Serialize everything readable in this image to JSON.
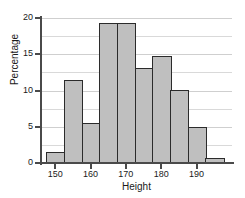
{
  "chart_data": {
    "type": "bar",
    "title": "",
    "subtitle": "",
    "xlabel": "Height",
    "ylabel": "Percentage",
    "xlim": [
      146,
      200
    ],
    "ylim": [
      0,
      20
    ],
    "grid": true,
    "legend": false,
    "legend_position": "none",
    "bar_color": "#bfbfbf",
    "bar_edge_color": "#2b2b2b",
    "grid_color": "#d9d9d9",
    "axis_color": "#4a4a4a",
    "bin_width": 5,
    "y_ticks": [
      "0",
      "5",
      "10",
      "15",
      "20"
    ],
    "y_tick_values": [
      0,
      5,
      10,
      15,
      20
    ],
    "y_minor_gridlines": [
      2.5,
      7.5,
      12.5,
      17.5
    ],
    "x_ticks": [
      "150",
      "160",
      "170",
      "180",
      "190"
    ],
    "x_tick_values": [
      150,
      160,
      170,
      180,
      190
    ],
    "categories": [
      "147.5-152.5",
      "152.5-157.5",
      "157.5-162.5",
      "162.5-167.5",
      "167.5-172.5",
      "172.5-177.5",
      "177.5-182.5",
      "182.5-187.5",
      "187.5-192.5",
      "192.5-197.5"
    ],
    "bin_edges": [
      147.5,
      152.5,
      157.5,
      162.5,
      167.5,
      172.5,
      177.5,
      182.5,
      187.5,
      192.5,
      197.5
    ],
    "values": [
      1.5,
      11.5,
      5.5,
      19.3,
      19.3,
      13.1,
      14.7,
      10.1,
      4.9,
      0.7
    ]
  },
  "axis_titles": {
    "x": "Height",
    "y": "Percentage"
  }
}
